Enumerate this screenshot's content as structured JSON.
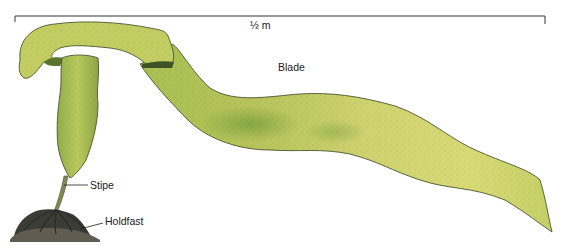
{
  "diagram": {
    "scale_bar": {
      "label": "½ m"
    },
    "labels": {
      "blade": "Blade",
      "stipe": "Stipe",
      "holdfast": "Holdfast"
    },
    "colors": {
      "blade_light": "#d8dc7a",
      "blade_mid": "#bcc85a",
      "blade_dark": "#7f9a3a",
      "outline": "#4a5530",
      "holdfast": "#3a3a34",
      "rock": "#5a564e",
      "line": "#222222"
    }
  }
}
